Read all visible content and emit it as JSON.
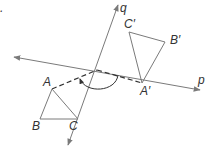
{
  "figure": {
    "type": "geometry-rotation-diagram",
    "marker": ".",
    "lines": [
      {
        "name": "p",
        "label": "p",
        "from": [
          14,
          57
        ],
        "to": [
          200,
          90
        ]
      },
      {
        "name": "q",
        "label": "q",
        "from": [
          68,
          145
        ],
        "to": [
          118,
          5
        ]
      }
    ],
    "intersection": [
      97,
      70
    ],
    "triangle_original": {
      "vertices": [
        {
          "label": "A",
          "point": [
            52,
            89
          ]
        },
        {
          "label": "B",
          "point": [
            40,
            119
          ]
        },
        {
          "label": "C",
          "point": [
            78,
            119
          ]
        }
      ]
    },
    "triangle_image": {
      "vertices": [
        {
          "label": "A′",
          "point": [
            142,
            83
          ]
        },
        {
          "label": "B′",
          "point": [
            165,
            42
          ]
        },
        {
          "label": "C′",
          "point": [
            129,
            32
          ]
        }
      ]
    },
    "dashed_segments": [
      {
        "from": "A",
        "to": "intersection"
      },
      {
        "from": "intersection",
        "to": "A′"
      }
    ],
    "rotation_arc": {
      "direction": "from A′ side to A side",
      "arrow_at": "A side"
    },
    "colors": {
      "lines": "#7a7a7a",
      "dashed": "#333333",
      "labels": "#333333"
    }
  }
}
